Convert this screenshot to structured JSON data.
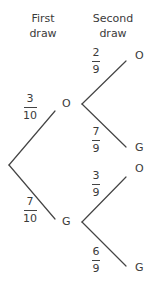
{
  "headers": {
    "first": "First\ndraw",
    "first_line1": "First",
    "first_line2": "draw",
    "second_line1": "Second",
    "second_line2": "draw"
  },
  "first_draw": [
    {
      "outcome": "O",
      "num": "3",
      "den": "10"
    },
    {
      "outcome": "G",
      "num": "7",
      "den": "10"
    }
  ],
  "second_draw": {
    "after_O": [
      {
        "outcome": "O",
        "num": "2",
        "den": "9"
      },
      {
        "outcome": "G",
        "num": "7",
        "den": "9"
      }
    ],
    "after_G": [
      {
        "outcome": "O",
        "num": "3",
        "den": "9"
      },
      {
        "outcome": "G",
        "num": "6",
        "den": "9"
      }
    ]
  },
  "colors": {
    "line": "#444444",
    "text": "#3a3a3a"
  }
}
